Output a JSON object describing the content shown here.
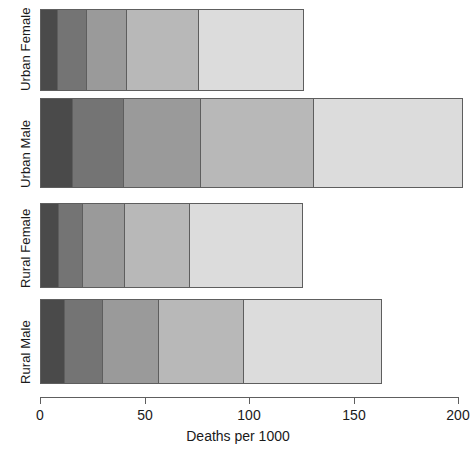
{
  "chart_data": {
    "type": "bar",
    "orientation": "horizontal",
    "stacked": true,
    "title": "",
    "subtitle": "",
    "xlabel": "Deaths per 1000",
    "ylabel": "",
    "xlim": [
      0,
      200
    ],
    "xticks": [
      0,
      50,
      100,
      150,
      200
    ],
    "xtick_labels": [
      "0",
      "50",
      "100",
      "150",
      "200"
    ],
    "grid": false,
    "legend": false,
    "legend_position": "none",
    "categories": [
      "Rural Male",
      "Rural Female",
      "Urban Male",
      "Urban Female"
    ],
    "category_order_top_to_bottom": [
      "Urban Female",
      "Urban Male",
      "Rural Female",
      "Rural Male"
    ],
    "series": [
      {
        "name": "50-54",
        "color": "#4a4a4a",
        "values": [
          11.7,
          8.7,
          15.4,
          8.4
        ]
      },
      {
        "name": "55-59",
        "color": "#747474",
        "values": [
          18.1,
          11.7,
          24.3,
          13.6
        ]
      },
      {
        "name": "60-64",
        "color": "#9a9a9a",
        "values": [
          26.9,
          20.3,
          37.0,
          19.3
        ]
      },
      {
        "name": "65-69",
        "color": "#b8b8b8",
        "values": [
          41.0,
          30.9,
          54.6,
          35.1
        ]
      },
      {
        "name": "70-74",
        "color": "#dcdcdc",
        "values": [
          66.0,
          54.3,
          71.1,
          50.0
        ]
      }
    ],
    "totals": [
      163.7,
      125.9,
      202.4,
      126.4
    ],
    "annotations": []
  },
  "axis": {
    "title": "Deaths per 1000",
    "tick_labels": [
      "0",
      "50",
      "100",
      "150",
      "200"
    ]
  },
  "categories": {
    "labels": [
      "Urban Female",
      "Urban Male",
      "Rural Female",
      "Rural Male"
    ]
  },
  "colors": {
    "background": "#ffffff",
    "outline": "#5e5e5e",
    "text": "#1a1a1a",
    "segment_1": "#4a4a4a",
    "segment_2": "#747474",
    "segment_3": "#9a9a9a",
    "segment_4": "#b8b8b8",
    "segment_5": "#dcdcdc"
  }
}
